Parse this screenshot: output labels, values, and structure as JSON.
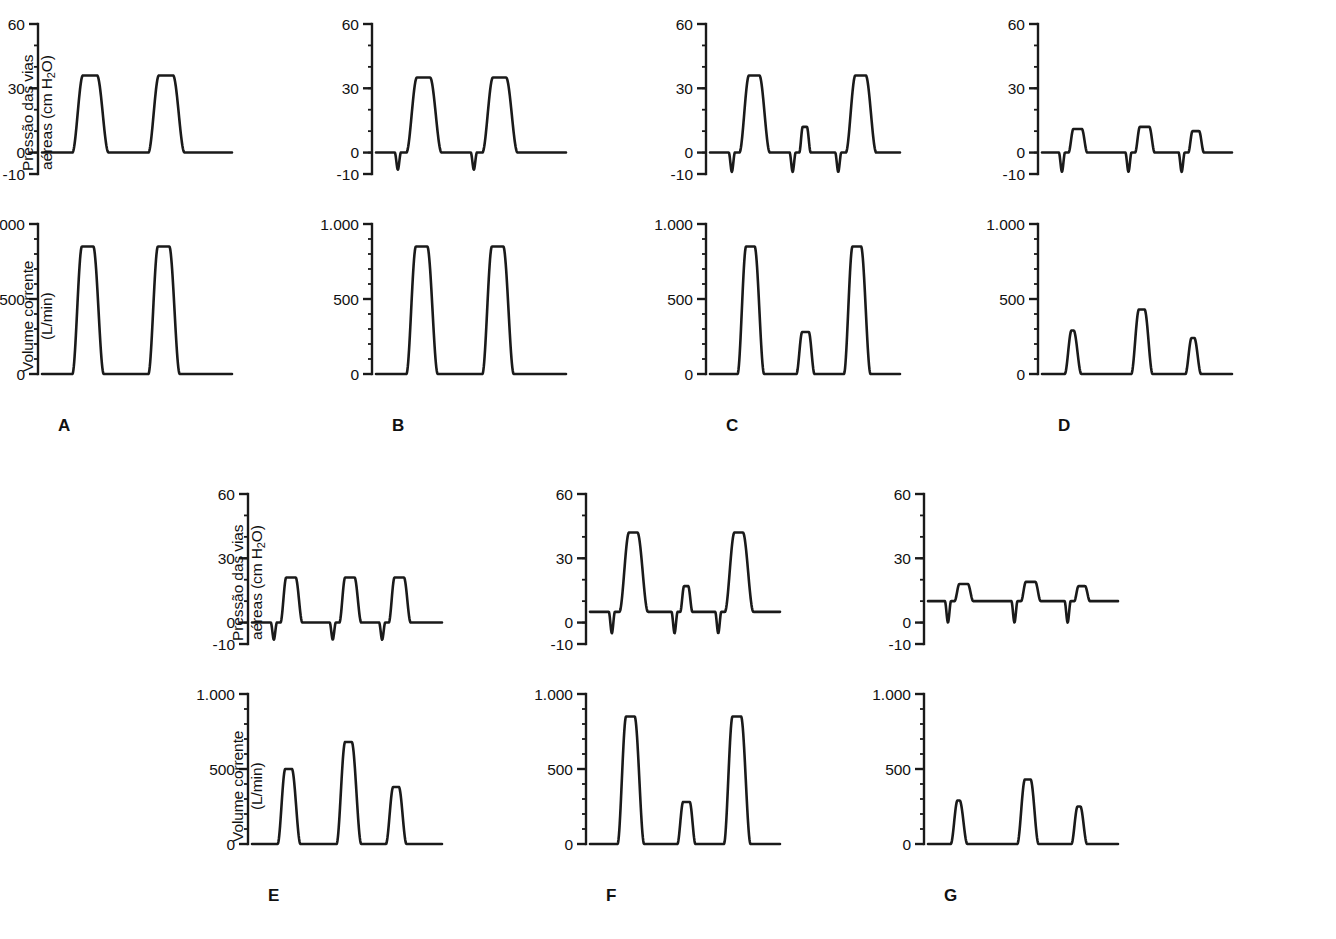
{
  "figure": {
    "title": "",
    "background_color": "#ffffff",
    "line_color": "#1a1a1a",
    "text_color": "#111111"
  },
  "axes": {
    "pressure": {
      "label_line1": "Pressão das vias",
      "label_line2": "aéreas (cm H",
      "label_sub": "2",
      "label_line3": "O)",
      "label_full": "Pressão das vias aéreas (cm H2O)",
      "ticks": [
        "60",
        "30",
        "0",
        "-10"
      ],
      "tick_values": [
        60,
        30,
        0,
        -10
      ],
      "ylim": [
        -10,
        60
      ],
      "minor_tick_step": 10
    },
    "volume": {
      "label_line1": "Volume corrente",
      "label_line2": "(L/min)",
      "label_full": "Volume corrente (L/min)",
      "ticks": [
        "1.000",
        "500",
        "0"
      ],
      "tick_values": [
        1000,
        500,
        0
      ],
      "ylim": [
        0,
        1000
      ],
      "minor_tick_step": 100
    }
  },
  "panels": [
    {
      "letter": "A",
      "row": 0,
      "col": 0,
      "pressure": {
        "baseline": 0,
        "trigger_dips": [],
        "breaths": [
          {
            "start": 0.16,
            "peak": 36,
            "rise": 0.055,
            "plateau": 0.075,
            "fall": 0.06
          },
          {
            "start": 0.56,
            "peak": 36,
            "rise": 0.055,
            "plateau": 0.075,
            "fall": 0.06
          }
        ]
      },
      "volume": {
        "baseline": 0,
        "breaths": [
          {
            "start": 0.16,
            "peak": 850,
            "rise": 0.05,
            "plateau": 0.06,
            "fall": 0.055
          },
          {
            "start": 0.56,
            "peak": 850,
            "rise": 0.05,
            "plateau": 0.06,
            "fall": 0.055
          }
        ]
      }
    },
    {
      "letter": "B",
      "row": 0,
      "col": 1,
      "pressure": {
        "baseline": 0,
        "trigger_dips": [
          {
            "at": 0.115,
            "depth": -8
          },
          {
            "at": 0.515,
            "depth": -8
          }
        ],
        "breaths": [
          {
            "start": 0.16,
            "peak": 35,
            "rise": 0.055,
            "plateau": 0.07,
            "fall": 0.06
          },
          {
            "start": 0.56,
            "peak": 35,
            "rise": 0.055,
            "plateau": 0.07,
            "fall": 0.06
          }
        ]
      },
      "volume": {
        "baseline": 0,
        "breaths": [
          {
            "start": 0.16,
            "peak": 850,
            "rise": 0.05,
            "plateau": 0.06,
            "fall": 0.055
          },
          {
            "start": 0.56,
            "peak": 850,
            "rise": 0.05,
            "plateau": 0.06,
            "fall": 0.055
          }
        ]
      }
    },
    {
      "letter": "C",
      "row": 0,
      "col": 2,
      "pressure": {
        "baseline": 0,
        "trigger_dips": [
          {
            "at": 0.115,
            "depth": -9
          },
          {
            "at": 0.435,
            "depth": -9
          },
          {
            "at": 0.675,
            "depth": -9
          }
        ],
        "breaths": [
          {
            "start": 0.155,
            "peak": 36,
            "rise": 0.05,
            "plateau": 0.055,
            "fall": 0.055
          },
          {
            "start": 0.47,
            "peak": 12,
            "rise": 0.018,
            "plateau": 0.022,
            "fall": 0.02
          },
          {
            "start": 0.715,
            "peak": 36,
            "rise": 0.05,
            "plateau": 0.055,
            "fall": 0.055
          }
        ]
      },
      "volume": {
        "baseline": 0,
        "breaths": [
          {
            "start": 0.145,
            "peak": 850,
            "rise": 0.045,
            "plateau": 0.045,
            "fall": 0.05
          },
          {
            "start": 0.455,
            "peak": 280,
            "rise": 0.03,
            "plateau": 0.035,
            "fall": 0.03
          },
          {
            "start": 0.705,
            "peak": 850,
            "rise": 0.045,
            "plateau": 0.045,
            "fall": 0.05
          }
        ]
      }
    },
    {
      "letter": "D",
      "row": 0,
      "col": 3,
      "pressure": {
        "baseline": 0,
        "trigger_dips": [
          {
            "at": 0.105,
            "depth": -9
          },
          {
            "at": 0.455,
            "depth": -9
          },
          {
            "at": 0.735,
            "depth": -9
          }
        ],
        "breaths": [
          {
            "start": 0.14,
            "peak": 11,
            "rise": 0.025,
            "plateau": 0.045,
            "fall": 0.028
          },
          {
            "start": 0.49,
            "peak": 12,
            "rise": 0.025,
            "plateau": 0.05,
            "fall": 0.028
          },
          {
            "start": 0.77,
            "peak": 10,
            "rise": 0.022,
            "plateau": 0.035,
            "fall": 0.025
          }
        ]
      },
      "volume": {
        "baseline": 0,
        "breaths": [
          {
            "start": 0.12,
            "peak": 290,
            "rise": 0.035,
            "plateau": 0.012,
            "fall": 0.04
          },
          {
            "start": 0.47,
            "peak": 430,
            "rise": 0.04,
            "plateau": 0.03,
            "fall": 0.042
          },
          {
            "start": 0.755,
            "peak": 240,
            "rise": 0.032,
            "plateau": 0.015,
            "fall": 0.035
          }
        ]
      }
    },
    {
      "letter": "E",
      "row": 1,
      "col": 0,
      "pressure": {
        "baseline": 0,
        "trigger_dips": [
          {
            "at": 0.115,
            "depth": -8
          },
          {
            "at": 0.425,
            "depth": -8
          },
          {
            "at": 0.685,
            "depth": -8
          }
        ],
        "breaths": [
          {
            "start": 0.15,
            "peak": 21,
            "rise": 0.03,
            "plateau": 0.05,
            "fall": 0.035
          },
          {
            "start": 0.46,
            "peak": 21,
            "rise": 0.03,
            "plateau": 0.05,
            "fall": 0.035
          },
          {
            "start": 0.72,
            "peak": 21,
            "rise": 0.03,
            "plateau": 0.05,
            "fall": 0.035
          }
        ]
      },
      "volume": {
        "baseline": 0,
        "breaths": [
          {
            "start": 0.135,
            "peak": 500,
            "rise": 0.04,
            "plateau": 0.035,
            "fall": 0.045
          },
          {
            "start": 0.445,
            "peak": 680,
            "rise": 0.045,
            "plateau": 0.035,
            "fall": 0.05
          },
          {
            "start": 0.705,
            "peak": 380,
            "rise": 0.038,
            "plateau": 0.03,
            "fall": 0.04
          }
        ]
      }
    },
    {
      "letter": "F",
      "row": 1,
      "col": 1,
      "pressure": {
        "baseline": 5,
        "trigger_dips": [
          {
            "at": 0.115,
            "depth": -5
          },
          {
            "at": 0.445,
            "depth": -5
          },
          {
            "at": 0.675,
            "depth": -5
          }
        ],
        "breaths": [
          {
            "start": 0.155,
            "peak": 42,
            "rise": 0.05,
            "plateau": 0.045,
            "fall": 0.055
          },
          {
            "start": 0.475,
            "peak": 17,
            "rise": 0.02,
            "plateau": 0.022,
            "fall": 0.022
          },
          {
            "start": 0.71,
            "peak": 42,
            "rise": 0.05,
            "plateau": 0.045,
            "fall": 0.055
          }
        ]
      },
      "volume": {
        "baseline": 0,
        "breaths": [
          {
            "start": 0.145,
            "peak": 850,
            "rise": 0.045,
            "plateau": 0.045,
            "fall": 0.05
          },
          {
            "start": 0.46,
            "peak": 280,
            "rise": 0.03,
            "plateau": 0.035,
            "fall": 0.03
          },
          {
            "start": 0.705,
            "peak": 850,
            "rise": 0.045,
            "plateau": 0.045,
            "fall": 0.05
          }
        ]
      }
    },
    {
      "letter": "G",
      "row": 1,
      "col": 2,
      "pressure": {
        "baseline": 10,
        "trigger_dips": [
          {
            "at": 0.105,
            "depth": 0
          },
          {
            "at": 0.455,
            "depth": 0
          },
          {
            "at": 0.735,
            "depth": 0
          }
        ],
        "breaths": [
          {
            "start": 0.14,
            "peak": 18,
            "rise": 0.025,
            "plateau": 0.045,
            "fall": 0.028
          },
          {
            "start": 0.49,
            "peak": 19,
            "rise": 0.025,
            "plateau": 0.05,
            "fall": 0.028
          },
          {
            "start": 0.77,
            "peak": 17,
            "rise": 0.022,
            "plateau": 0.035,
            "fall": 0.025
          }
        ]
      },
      "volume": {
        "baseline": 0,
        "breaths": [
          {
            "start": 0.12,
            "peak": 290,
            "rise": 0.035,
            "plateau": 0.012,
            "fall": 0.04
          },
          {
            "start": 0.47,
            "peak": 430,
            "rise": 0.04,
            "plateau": 0.03,
            "fall": 0.042
          },
          {
            "start": 0.755,
            "peak": 250,
            "rise": 0.032,
            "plateau": 0.015,
            "fall": 0.035
          }
        ]
      }
    }
  ],
  "chart_data": {
    "type": "line",
    "title": "",
    "subtitle": "",
    "panel_count": 7,
    "panel_labels": [
      "A",
      "B",
      "C",
      "D",
      "E",
      "F",
      "G"
    ],
    "layout": "2 rows: A-D on top row, E-G on bottom row; each panel has a pressure trace above a volume trace",
    "grid": false,
    "legend_position": "none",
    "series": [
      {
        "name": "A - pressure",
        "ylabel": "Pressão das vias aéreas (cm H2O)",
        "ylim": [
          -10,
          60
        ],
        "yticks": [
          -10,
          0,
          30,
          60
        ],
        "baseline": 0,
        "peaks": [
          36,
          36
        ],
        "trigger_dips": []
      },
      {
        "name": "A - volume",
        "ylabel": "Volume corrente (L/min)",
        "ylim": [
          0,
          1000
        ],
        "yticks": [
          0,
          500,
          1000
        ],
        "baseline": 0,
        "peaks": [
          850,
          850
        ]
      },
      {
        "name": "B - pressure",
        "ylabel": "Pressão das vias aéreas (cm H2O)",
        "ylim": [
          -10,
          60
        ],
        "yticks": [
          -10,
          0,
          30,
          60
        ],
        "baseline": 0,
        "peaks": [
          35,
          35
        ],
        "trigger_dips": [
          -8,
          -8
        ]
      },
      {
        "name": "B - volume",
        "ylabel": "Volume corrente (L/min)",
        "ylim": [
          0,
          1000
        ],
        "yticks": [
          0,
          500,
          1000
        ],
        "baseline": 0,
        "peaks": [
          850,
          850
        ]
      },
      {
        "name": "C - pressure",
        "ylabel": "Pressão das vias aéreas (cm H2O)",
        "ylim": [
          -10,
          60
        ],
        "yticks": [
          -10,
          0,
          30,
          60
        ],
        "baseline": 0,
        "peaks": [
          36,
          12,
          36
        ],
        "trigger_dips": [
          -9,
          -9,
          -9
        ]
      },
      {
        "name": "C - volume",
        "ylabel": "Volume corrente (L/min)",
        "ylim": [
          0,
          1000
        ],
        "yticks": [
          0,
          500,
          1000
        ],
        "baseline": 0,
        "peaks": [
          850,
          280,
          850
        ]
      },
      {
        "name": "D - pressure",
        "ylabel": "Pressão das vias aéreas (cm H2O)",
        "ylim": [
          -10,
          60
        ],
        "yticks": [
          -10,
          0,
          30,
          60
        ],
        "baseline": 0,
        "peaks": [
          11,
          12,
          10
        ],
        "trigger_dips": [
          -9,
          -9,
          -9
        ]
      },
      {
        "name": "D - volume",
        "ylabel": "Volume corrente (L/min)",
        "ylim": [
          0,
          1000
        ],
        "yticks": [
          0,
          500,
          1000
        ],
        "baseline": 0,
        "peaks": [
          290,
          430,
          240
        ]
      },
      {
        "name": "E - pressure",
        "ylabel": "Pressão das vias aéreas (cm H2O)",
        "ylim": [
          -10,
          60
        ],
        "yticks": [
          -10,
          0,
          30,
          60
        ],
        "baseline": 0,
        "peaks": [
          21,
          21,
          21
        ],
        "trigger_dips": [
          -8,
          -8,
          -8
        ]
      },
      {
        "name": "E - volume",
        "ylabel": "Volume corrente (L/min)",
        "ylim": [
          0,
          1000
        ],
        "yticks": [
          0,
          500,
          1000
        ],
        "baseline": 0,
        "peaks": [
          500,
          680,
          380
        ]
      },
      {
        "name": "F - pressure",
        "ylabel": "Pressão das vias aéreas (cm H2O)",
        "ylim": [
          -10,
          60
        ],
        "yticks": [
          -10,
          0,
          30,
          60
        ],
        "baseline": 5,
        "peaks": [
          42,
          17,
          42
        ],
        "trigger_dips": [
          -5,
          -5,
          -5
        ]
      },
      {
        "name": "F - volume",
        "ylabel": "Volume corrente (L/min)",
        "ylim": [
          0,
          1000
        ],
        "yticks": [
          0,
          500,
          1000
        ],
        "baseline": 0,
        "peaks": [
          850,
          280,
          850
        ]
      },
      {
        "name": "G - pressure",
        "ylabel": "Pressão das vias aéreas (cm H2O)",
        "ylim": [
          -10,
          60
        ],
        "yticks": [
          -10,
          0,
          30,
          60
        ],
        "baseline": 10,
        "peaks": [
          18,
          19,
          17
        ],
        "trigger_dips": [
          0,
          0,
          0
        ]
      },
      {
        "name": "G - volume",
        "ylabel": "Volume corrente (L/min)",
        "ylim": [
          0,
          1000
        ],
        "yticks": [
          0,
          500,
          1000
        ],
        "baseline": 0,
        "peaks": [
          290,
          430,
          250
        ]
      }
    ]
  }
}
